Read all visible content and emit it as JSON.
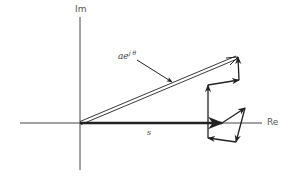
{
  "diagram": {
    "type": "complex-plane-phasor-sum",
    "axes": {
      "imag_label": "Im",
      "real_label": "Re"
    },
    "labels": {
      "resultant": "ae",
      "resultant_exp": "j θ",
      "sum_vector": "s"
    },
    "colors": {
      "axis": "#444444",
      "vector": "#222222",
      "background": "#ffffff"
    },
    "geometry": {
      "origin": [
        80,
        123
      ],
      "s_tip": [
        222,
        123
      ],
      "chain_points": [
        [
          222,
          123
        ],
        [
          245,
          108
        ],
        [
          236,
          142
        ],
        [
          208,
          138
        ],
        [
          208,
          85
        ],
        [
          239,
          80
        ],
        [
          238,
          57
        ]
      ],
      "resultant_tip": [
        238,
        57
      ]
    }
  }
}
